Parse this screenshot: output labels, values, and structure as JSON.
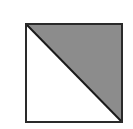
{
  "diagram": {
    "shape": "square-split-diagonal",
    "square": {
      "x": 25,
      "y": 23,
      "size": 98
    },
    "diagonal": "top-left to bottom-right",
    "shaded_region": "upper-right triangle",
    "colors": {
      "background": "#ffffff",
      "border": "#2a2a2a",
      "shade": "#8c8c8c",
      "unshaded": "#ffffff"
    }
  }
}
